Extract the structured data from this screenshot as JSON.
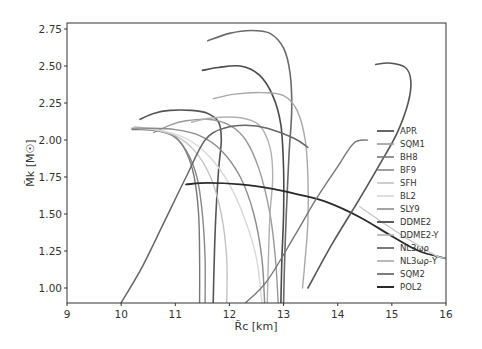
{
  "chart_data": {
    "type": "line",
    "title": "",
    "xlabel": "R̃c [km]",
    "ylabel": "M̃k [M☉]",
    "xlim": [
      9,
      16
    ],
    "ylim": [
      0.9,
      2.79
    ],
    "xticks": [
      "9",
      "10",
      "11",
      "12",
      "13",
      "14",
      "15",
      "16"
    ],
    "yticks": [
      "1.00",
      "1.25",
      "1.50",
      "1.75",
      "2.00",
      "2.25",
      "2.50",
      "2.75"
    ],
    "grid": false,
    "legend_position": "center right",
    "series": [
      {
        "name": "APR",
        "color": "#555555",
        "width": 1.6,
        "points": [
          [
            11.7,
            0.9
          ],
          [
            11.72,
            1.2
          ],
          [
            11.75,
            1.5
          ],
          [
            11.8,
            1.8
          ],
          [
            11.85,
            2.0
          ],
          [
            11.8,
            2.12
          ],
          [
            11.6,
            2.18
          ],
          [
            11.3,
            2.2
          ],
          [
            10.9,
            2.2
          ],
          [
            10.6,
            2.18
          ],
          [
            10.35,
            2.14
          ]
        ]
      },
      {
        "name": "SQM1",
        "color": "#9a9a9a",
        "width": 1.4,
        "points": [
          [
            12.9,
            0.9
          ],
          [
            12.85,
            1.2
          ],
          [
            12.75,
            1.5
          ],
          [
            12.55,
            1.8
          ],
          [
            12.3,
            2.0
          ],
          [
            12.0,
            2.1
          ],
          [
            11.6,
            2.14
          ],
          [
            11.2,
            2.13
          ],
          [
            10.9,
            2.1
          ],
          [
            10.6,
            2.05
          ]
        ]
      },
      {
        "name": "BH8",
        "color": "#777777",
        "width": 1.4,
        "points": [
          [
            11.45,
            0.9
          ],
          [
            11.45,
            1.2
          ],
          [
            11.43,
            1.5
          ],
          [
            11.35,
            1.75
          ],
          [
            11.2,
            1.92
          ],
          [
            11.0,
            2.02
          ],
          [
            10.7,
            2.06
          ],
          [
            10.4,
            2.07
          ],
          [
            10.2,
            2.07
          ]
        ]
      },
      {
        "name": "BF9",
        "color": "#888888",
        "width": 1.4,
        "points": [
          [
            11.55,
            0.9
          ],
          [
            11.55,
            1.2
          ],
          [
            11.5,
            1.5
          ],
          [
            11.4,
            1.75
          ],
          [
            11.2,
            1.93
          ],
          [
            10.95,
            2.03
          ],
          [
            10.6,
            2.07
          ],
          [
            10.3,
            2.08
          ]
        ]
      },
      {
        "name": "SFH",
        "color": "#c4c4c4",
        "width": 1.4,
        "points": [
          [
            11.95,
            0.9
          ],
          [
            11.95,
            1.2
          ],
          [
            11.85,
            1.5
          ],
          [
            11.65,
            1.75
          ],
          [
            11.35,
            1.93
          ],
          [
            11.0,
            2.03
          ],
          [
            10.6,
            2.07
          ],
          [
            10.25,
            2.09
          ]
        ]
      },
      {
        "name": "BL2",
        "color": "#d8d8d8",
        "width": 1.4,
        "points": [
          [
            12.6,
            0.9
          ],
          [
            12.5,
            1.2
          ],
          [
            12.3,
            1.45
          ],
          [
            12.0,
            1.7
          ],
          [
            11.65,
            1.88
          ],
          [
            11.25,
            2.0
          ],
          [
            10.8,
            2.06
          ],
          [
            10.3,
            2.08
          ]
        ]
      },
      {
        "name": "SLY9",
        "color": "#8c8c8c",
        "width": 1.4,
        "points": [
          [
            12.65,
            0.9
          ],
          [
            12.6,
            1.2
          ],
          [
            12.45,
            1.5
          ],
          [
            12.2,
            1.75
          ],
          [
            11.85,
            1.93
          ],
          [
            11.45,
            2.03
          ],
          [
            11.0,
            2.07
          ],
          [
            10.5,
            2.08
          ],
          [
            10.2,
            2.08
          ]
        ]
      },
      {
        "name": "DDME2",
        "color": "#4a4a4a",
        "width": 1.6,
        "points": [
          [
            12.95,
            0.9
          ],
          [
            12.97,
            1.2
          ],
          [
            13.0,
            1.5
          ],
          [
            13.0,
            1.8
          ],
          [
            12.95,
            2.1
          ],
          [
            12.8,
            2.3
          ],
          [
            12.55,
            2.44
          ],
          [
            12.2,
            2.5
          ],
          [
            11.8,
            2.49
          ],
          [
            11.5,
            2.47
          ]
        ]
      },
      {
        "name": "DDME2-Y",
        "color": "#b0b0b0",
        "width": 1.4,
        "points": [
          [
            12.7,
            0.9
          ],
          [
            12.72,
            1.2
          ],
          [
            12.75,
            1.5
          ],
          [
            12.8,
            1.75
          ],
          [
            12.75,
            1.95
          ],
          [
            12.55,
            2.1
          ],
          [
            12.2,
            2.15
          ],
          [
            11.7,
            2.15
          ],
          [
            11.3,
            2.12
          ]
        ]
      },
      {
        "name": "NL3ωρ",
        "color": "#6a6a6a",
        "width": 1.6,
        "points": [
          [
            13.0,
            0.9
          ],
          [
            13.02,
            1.2
          ],
          [
            13.05,
            1.5
          ],
          [
            13.1,
            1.9
          ],
          [
            13.15,
            2.2
          ],
          [
            13.12,
            2.45
          ],
          [
            13.0,
            2.62
          ],
          [
            12.75,
            2.72
          ],
          [
            12.4,
            2.74
          ],
          [
            12.0,
            2.72
          ],
          [
            11.6,
            2.67
          ]
        ]
      },
      {
        "name": "NL3ωρ-Y",
        "color": "#a8a8a8",
        "width": 1.4,
        "points": [
          [
            13.35,
            1.0
          ],
          [
            13.4,
            1.2
          ],
          [
            13.45,
            1.45
          ],
          [
            13.45,
            1.75
          ],
          [
            13.4,
            2.0
          ],
          [
            13.25,
            2.2
          ],
          [
            13.0,
            2.3
          ],
          [
            12.6,
            2.32
          ],
          [
            12.1,
            2.31
          ],
          [
            11.7,
            2.28
          ]
        ]
      },
      {
        "name": "SQM2",
        "color": "#666666",
        "width": 1.5,
        "points": [
          [
            10.0,
            0.9
          ],
          [
            10.4,
            1.15
          ],
          [
            10.8,
            1.45
          ],
          [
            11.2,
            1.75
          ],
          [
            11.55,
            2.0
          ],
          [
            11.9,
            2.08
          ],
          [
            12.3,
            2.1
          ],
          [
            12.7,
            2.08
          ],
          [
            13.2,
            2.01
          ],
          [
            13.45,
            1.95
          ]
        ]
      },
      {
        "name": "POL2",
        "color": "#2a2a2a",
        "width": 1.8,
        "points": [
          [
            11.2,
            1.7
          ],
          [
            11.6,
            1.71
          ],
          [
            12.2,
            1.7
          ],
          [
            12.8,
            1.67
          ],
          [
            13.3,
            1.63
          ],
          [
            13.8,
            1.58
          ],
          [
            14.4,
            1.48
          ],
          [
            15.0,
            1.35
          ],
          [
            15.5,
            1.25
          ],
          [
            16.0,
            1.2
          ]
        ]
      },
      {
        "name": "SQM2-high",
        "color": "#555555",
        "width": 1.6,
        "legend": false,
        "points": [
          [
            13.45,
            1.0
          ],
          [
            13.9,
            1.3
          ],
          [
            14.4,
            1.6
          ],
          [
            14.8,
            1.85
          ],
          [
            15.1,
            2.05
          ],
          [
            15.3,
            2.25
          ],
          [
            15.35,
            2.4
          ],
          [
            15.25,
            2.49
          ],
          [
            14.95,
            2.52
          ],
          [
            14.7,
            2.51
          ]
        ]
      },
      {
        "name": "BH8-branch",
        "color": "#777777",
        "width": 1.4,
        "legend": false,
        "points": [
          [
            12.3,
            0.9
          ],
          [
            12.7,
            1.05
          ],
          [
            13.2,
            1.35
          ],
          [
            13.6,
            1.6
          ],
          [
            14.0,
            1.82
          ],
          [
            14.3,
            1.98
          ],
          [
            14.55,
            2.0
          ]
        ]
      },
      {
        "name": "SFH-tail",
        "color": "#c4c4c4",
        "width": 1.2,
        "legend": false,
        "points": [
          [
            14.4,
            1.55
          ],
          [
            14.8,
            1.45
          ],
          [
            15.3,
            1.33
          ],
          [
            15.8,
            1.22
          ],
          [
            16.0,
            1.2
          ]
        ]
      }
    ]
  }
}
